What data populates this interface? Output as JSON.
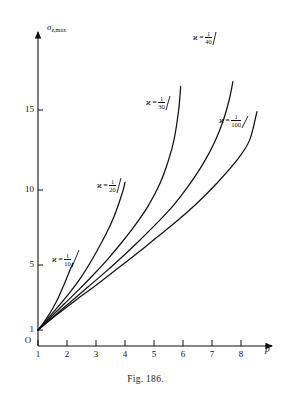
{
  "figure": {
    "caption": "Fig. 186.",
    "axes": {
      "y_label_symbol": "σ",
      "y_label_sub": "z,max",
      "x_label_symbol": "p",
      "x_label_overbar": true,
      "origin_label": "O",
      "x_ticks": [
        "1",
        "2",
        "3",
        "4",
        "5",
        "6",
        "7",
        "8"
      ],
      "y_ticks": [
        "1",
        "5",
        "10",
        "15"
      ]
    },
    "curve_labels": [
      {
        "symbol": "ϰ",
        "eq": "=",
        "num": "1",
        "den": "10"
      },
      {
        "symbol": "ϰ",
        "eq": "=",
        "num": "1",
        "den": "20"
      },
      {
        "symbol": "ϰ",
        "eq": "=",
        "num": "1",
        "den": "30"
      },
      {
        "symbol": "ϰ",
        "eq": "=",
        "num": "1",
        "den": "40"
      },
      {
        "symbol": "ϰ",
        "eq": "=",
        "num": "1",
        "den": "100"
      }
    ]
  },
  "chart_data": {
    "type": "line",
    "title": "Fig. 186.",
    "xlabel": "p̄",
    "ylabel": "σ_z,max",
    "xlim": [
      1,
      8.6
    ],
    "ylim": [
      0,
      17.5
    ],
    "grid": false,
    "legend": "inline-curve-labels",
    "xticks": [
      1,
      2,
      3,
      4,
      5,
      6,
      7,
      8
    ],
    "yticks": [
      1,
      5,
      10,
      15
    ],
    "series": [
      {
        "name": "ϰ = 1/10",
        "x": [
          1.0,
          1.15,
          1.3,
          1.5,
          1.7,
          1.9,
          2.0,
          2.1,
          2.17,
          2.2
        ],
        "y": [
          1.0,
          1.35,
          1.75,
          2.35,
          3.05,
          3.9,
          4.35,
          4.8,
          5.1,
          5.25
        ]
      },
      {
        "name": "ϰ = 1/20",
        "x": [
          1.0,
          1.3,
          1.7,
          2.1,
          2.5,
          2.9,
          3.2,
          3.5,
          3.7,
          3.85,
          3.95,
          4.0
        ],
        "y": [
          1.0,
          1.65,
          2.5,
          3.4,
          4.4,
          5.6,
          6.6,
          7.7,
          8.6,
          9.4,
          10.0,
          10.4
        ]
      },
      {
        "name": "ϰ = 1/30",
        "x": [
          1.0,
          1.4,
          1.9,
          2.4,
          2.9,
          3.4,
          3.9,
          4.4,
          4.8,
          5.2,
          5.5,
          5.7,
          5.85,
          5.92
        ],
        "y": [
          1.0,
          1.75,
          2.65,
          3.55,
          4.5,
          5.5,
          6.6,
          7.8,
          8.9,
          10.3,
          11.8,
          13.2,
          15.0,
          16.5
        ]
      },
      {
        "name": "ϰ = 1/40",
        "x": [
          1.0,
          1.5,
          2.1,
          2.7,
          3.3,
          3.9,
          4.5,
          5.1,
          5.7,
          6.2,
          6.7,
          7.1,
          7.4,
          7.6,
          7.72
        ],
        "y": [
          1.0,
          1.8,
          2.75,
          3.7,
          4.65,
          5.65,
          6.7,
          7.8,
          9.0,
          10.2,
          11.6,
          13.0,
          14.4,
          15.7,
          16.8
        ]
      },
      {
        "name": "ϰ = 1/100",
        "x": [
          1.0,
          1.6,
          2.3,
          3.0,
          3.7,
          4.4,
          5.1,
          5.8,
          6.5,
          7.2,
          7.9,
          8.3,
          8.55
        ],
        "y": [
          1.0,
          1.9,
          2.9,
          3.85,
          4.85,
          5.85,
          6.9,
          7.95,
          9.1,
          10.4,
          11.9,
          13.1,
          14.9
        ]
      }
    ]
  }
}
